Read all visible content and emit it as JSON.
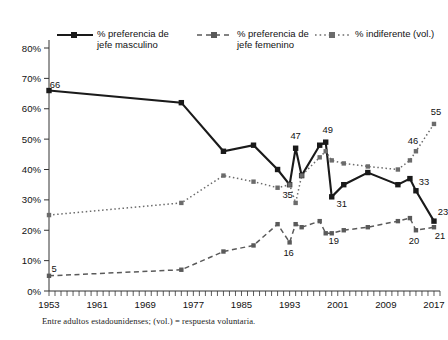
{
  "chart_data": {
    "type": "line",
    "title": "",
    "subtitle": "",
    "xlabel": "",
    "ylabel": "",
    "note": "Entre adultos estadounidenses; (vol.) = respuesta voluntaria.",
    "grid": false,
    "legend_position": "top",
    "xlim": [
      1953,
      2018
    ],
    "ylim": [
      0,
      80
    ],
    "yticks": [
      0,
      10,
      20,
      30,
      40,
      50,
      60,
      70,
      80
    ],
    "ytick_labels": [
      "0%",
      "10%",
      "20%",
      "30%",
      "40%",
      "50%",
      "60%",
      "70%",
      "80%"
    ],
    "xticks": [
      1953,
      1961,
      1969,
      1977,
      1985,
      1993,
      2001,
      2009,
      2017
    ],
    "xtick_labels": [
      "1953",
      "1961",
      "1969",
      "1977",
      "1985",
      "1993",
      "2001",
      "2009",
      "2017"
    ],
    "minor_xtick_step": 1,
    "series": [
      {
        "name": "% preferencia de jefe masculino",
        "key": "masculino",
        "line_style": "solid",
        "color": "#1a1a1a",
        "marker": "square",
        "x": [
          1953,
          1975,
          1982,
          1987,
          1991,
          1993,
          1994,
          1995,
          1998,
          1999,
          2000,
          2002,
          2006,
          2011,
          2013,
          2014,
          2017
        ],
        "values": [
          66,
          62,
          46,
          48,
          40,
          35,
          47,
          38,
          48,
          49,
          31,
          35,
          39,
          35,
          37,
          33,
          23
        ],
        "labels": [
          {
            "x": 1953,
            "y": 66,
            "text": "66"
          },
          {
            "x": 1994,
            "y": 47,
            "text": "47"
          },
          {
            "x": 1993,
            "y": 35,
            "text": "35"
          },
          {
            "x": 1999,
            "y": 49,
            "text": "49"
          },
          {
            "x": 2000,
            "y": 31,
            "text": "31"
          },
          {
            "x": 2014,
            "y": 33,
            "text": "33"
          },
          {
            "x": 2017,
            "y": 23,
            "text": "23"
          }
        ]
      },
      {
        "name": "% preferencia de jefe femenino",
        "key": "femenino",
        "line_style": "dashed",
        "color": "#5a5a5a",
        "marker": "square",
        "x": [
          1953,
          1975,
          1982,
          1987,
          1991,
          1993,
          1994,
          1995,
          1998,
          1999,
          2000,
          2002,
          2006,
          2011,
          2013,
          2014,
          2017
        ],
        "values": [
          5,
          7,
          13,
          15,
          22,
          16,
          22,
          21,
          23,
          19,
          19,
          20,
          21,
          23,
          24,
          20,
          21
        ],
        "labels": [
          {
            "x": 1953,
            "y": 5,
            "text": "5"
          },
          {
            "x": 1993,
            "y": 16,
            "text": "16"
          },
          {
            "x": 1999,
            "y": 19,
            "text": "19"
          },
          {
            "x": 2014,
            "y": 20,
            "text": "20"
          },
          {
            "x": 2017,
            "y": 21,
            "text": "21"
          }
        ]
      },
      {
        "name": "% indiferente (vol.)",
        "key": "indiferente",
        "line_style": "dotted",
        "color": "#6b6b6b",
        "marker": "square",
        "x": [
          1953,
          1975,
          1982,
          1987,
          1991,
          1993,
          1994,
          1995,
          1998,
          1999,
          2000,
          2002,
          2006,
          2011,
          2013,
          2014,
          2017
        ],
        "values": [
          25,
          29,
          38,
          36,
          34,
          35,
          29,
          38,
          44,
          46,
          43,
          42,
          41,
          40,
          43,
          46,
          55
        ],
        "labels": [
          {
            "x": 2014,
            "y": 46,
            "text": "46"
          },
          {
            "x": 2017,
            "y": 55,
            "text": "55"
          }
        ]
      }
    ]
  },
  "legend": {
    "items": [
      {
        "name": "legend-masculino",
        "label": "% preferencia de\njefe masculino",
        "style": "solid",
        "color": "#1a1a1a"
      },
      {
        "name": "legend-femenino",
        "label": "% preferencia de\njefe femenino",
        "style": "dashed",
        "color": "#5a5a5a"
      },
      {
        "name": "legend-indiferente",
        "label": "% indiferente (vol.)",
        "style": "dotted",
        "color": "#6b6b6b"
      }
    ]
  }
}
